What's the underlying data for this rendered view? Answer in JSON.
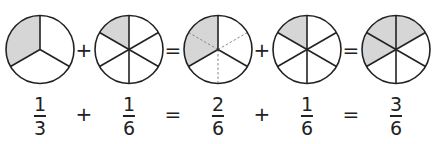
{
  "colors": {
    "stroke": "#222222",
    "fill_shaded": "#d6d6d6",
    "fill_empty": "#ffffff",
    "dashed": "#888888"
  },
  "circles": [
    {
      "cx": 40,
      "divisions": 3,
      "shaded_from_deg": 240,
      "shaded_to_deg": 360,
      "dashed_divisions": 0,
      "label": "one third"
    },
    {
      "cx": 129,
      "divisions": 6,
      "shaded_from_deg": 300,
      "shaded_to_deg": 360,
      "dashed_divisions": 0,
      "label": "one sixth"
    },
    {
      "cx": 218,
      "divisions": 3,
      "shaded_from_deg": 240,
      "shaded_to_deg": 360,
      "dashed_divisions": 6,
      "label": "two sixths"
    },
    {
      "cx": 307,
      "divisions": 6,
      "shaded_from_deg": 300,
      "shaded_to_deg": 360,
      "dashed_divisions": 0,
      "label": "one sixth"
    },
    {
      "cx": 396,
      "divisions": 6,
      "shaded_from_deg": 240,
      "shaded_to_deg": 420,
      "dashed_divisions": 0,
      "label": "three sixths"
    }
  ],
  "circle_geometry": {
    "cy": 49.5,
    "r": 34
  },
  "operators_top": [
    {
      "x": 84,
      "symbol": "+"
    },
    {
      "x": 173,
      "symbol": "="
    },
    {
      "x": 262,
      "symbol": "+"
    },
    {
      "x": 351,
      "symbol": "="
    }
  ],
  "fractions": [
    {
      "x": 40,
      "numerator": "1",
      "denominator": "3"
    },
    {
      "x": 129,
      "numerator": "1",
      "denominator": "6"
    },
    {
      "x": 218,
      "numerator": "2",
      "denominator": "6"
    },
    {
      "x": 307,
      "numerator": "1",
      "denominator": "6"
    },
    {
      "x": 396,
      "numerator": "3",
      "denominator": "6"
    }
  ],
  "operators_bottom": [
    {
      "x": 84,
      "symbol": "+"
    },
    {
      "x": 173,
      "symbol": "="
    },
    {
      "x": 262,
      "symbol": "+"
    },
    {
      "x": 351,
      "symbol": "="
    }
  ]
}
